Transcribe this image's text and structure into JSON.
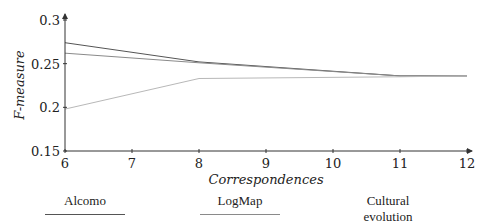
{
  "chart_data": {
    "type": "line",
    "title": "",
    "xlabel": "Correspondences",
    "ylabel": "F-measure",
    "xlim": [
      6,
      12
    ],
    "ylim": [
      0.15,
      0.3
    ],
    "xticks": [
      6,
      7,
      8,
      9,
      10,
      11,
      12
    ],
    "yticks": [
      0.15,
      0.2,
      0.25,
      0.3
    ],
    "xtick_labels": [
      "6",
      "7",
      "8",
      "9",
      "10",
      "11",
      "12"
    ],
    "ytick_labels": [
      "0.15",
      "0.2",
      "0.25",
      "0.3"
    ],
    "grid": false,
    "legend_position": "below",
    "series": [
      {
        "name": "Alcomo",
        "color": "#555555",
        "points": [
          [
            6,
            0.274
          ],
          [
            8,
            0.252
          ],
          [
            11,
            0.236
          ],
          [
            12,
            0.236
          ]
        ]
      },
      {
        "name": "LogMap",
        "color": "#8a8a8a",
        "points": [
          [
            6,
            0.262
          ],
          [
            8,
            0.251
          ],
          [
            11,
            0.236
          ],
          [
            12,
            0.236
          ]
        ]
      },
      {
        "name": "Cultural evolution",
        "color": "#b8b8b8",
        "points": [
          [
            6,
            0.198
          ],
          [
            8,
            0.233
          ],
          [
            11,
            0.235
          ],
          [
            12,
            0.236
          ]
        ]
      }
    ]
  },
  "legend": {
    "items": [
      {
        "label": "Alcomo"
      },
      {
        "label": "LogMap"
      },
      {
        "label": "Cultural evolution"
      }
    ]
  }
}
